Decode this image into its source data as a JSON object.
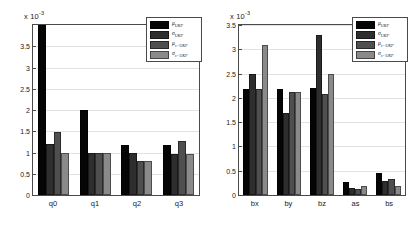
{
  "figure": {
    "background_color": "#ffffff",
    "axis_color": "#4a4a4a",
    "grid_color": "#e2e2e2"
  },
  "series_colors": [
    "#050505",
    "#2e2e2e",
    "#4f4f4f",
    "#8a8a8a"
  ],
  "legend": {
    "entries": [
      {
        "label": "μ",
        "sub": "UKF"
      },
      {
        "label": "σ",
        "sub": "UKF"
      },
      {
        "label": "μ",
        "sub": "s−UKF"
      },
      {
        "label": "σ",
        "sub": "s−UKF"
      }
    ]
  },
  "chart_data": [
    {
      "id": "left",
      "type": "bar",
      "title": "",
      "xlabel": "",
      "ylabel": "",
      "multiplier_text": "x 10",
      "multiplier_exp": "-3",
      "multiplier": 0.001,
      "ylim": [
        0,
        4.0
      ],
      "yticks": [
        0,
        0.5,
        1,
        1.5,
        2,
        2.5,
        3,
        3.5
      ],
      "ytick_labels": [
        "0",
        "0.5",
        "1",
        "1.5",
        "2",
        "2.5",
        "3",
        "3.5"
      ],
      "grid": true,
      "legend_position": "top-right",
      "categories": [
        "q0",
        "q1",
        "q2",
        "q3"
      ],
      "series": [
        {
          "name": "μ_UKF",
          "values": [
            4.0,
            2.0,
            1.18,
            1.18
          ]
        },
        {
          "name": "σ_UKF",
          "values": [
            1.19,
            1.0,
            0.98,
            0.97
          ]
        },
        {
          "name": "μ_s-UKF",
          "values": [
            1.48,
            1.0,
            0.79,
            1.28
          ]
        },
        {
          "name": "σ_s-UKF",
          "values": [
            0.98,
            0.98,
            0.8,
            0.97
          ]
        }
      ]
    },
    {
      "id": "right",
      "type": "bar",
      "title": "",
      "xlabel": "",
      "ylabel": "",
      "multiplier_text": "x 10",
      "multiplier_exp": "-3",
      "multiplier": 0.001,
      "ylim": [
        0,
        3.5
      ],
      "yticks": [
        0,
        0.5,
        1,
        1.5,
        2,
        2.5,
        3,
        3.5
      ],
      "ytick_labels": [
        "0",
        "0.5",
        "1",
        "1.5",
        "2",
        "2.5",
        "3",
        "3.5"
      ],
      "grid": true,
      "legend_position": "top-right",
      "categories": [
        "bx",
        "by",
        "bz",
        "as",
        "bs"
      ],
      "series": [
        {
          "name": "μ_UKF",
          "values": [
            2.18,
            2.18,
            2.2,
            0.27,
            0.45
          ]
        },
        {
          "name": "σ_UKF",
          "values": [
            2.5,
            1.69,
            3.3,
            0.14,
            0.28
          ]
        },
        {
          "name": "μ_s-UKF",
          "values": [
            2.19,
            2.12,
            2.08,
            0.12,
            0.32
          ]
        },
        {
          "name": "σ_s-UKF",
          "values": [
            3.09,
            2.12,
            2.49,
            0.19,
            0.19
          ]
        }
      ]
    }
  ]
}
